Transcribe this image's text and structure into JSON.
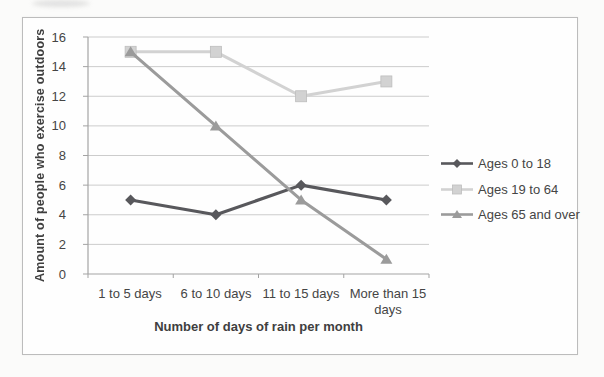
{
  "chart_data": {
    "type": "line",
    "title": "",
    "xlabel": "Number of days of rain per month",
    "ylabel": "Amount of people who exercise outdoors",
    "categories": [
      "1 to 5 days",
      "6 to 10 days",
      "11 to 15 days",
      "More than 15 days"
    ],
    "series": [
      {
        "name": "Ages 0 to 18",
        "values": [
          5,
          4,
          6,
          5
        ],
        "color": "#58585c",
        "marker": "diamond"
      },
      {
        "name": "Ages 19 to 64",
        "values": [
          15,
          15,
          12,
          13
        ],
        "color": "#d2d2d2",
        "marker": "square"
      },
      {
        "name": "Ages 65 and over",
        "values": [
          15,
          10,
          5,
          1
        ],
        "color": "#9b9b9b",
        "marker": "triangle"
      }
    ],
    "ylim": [
      0,
      16
    ],
    "ytick_step": 2,
    "yticks": [
      0,
      2,
      4,
      6,
      8,
      10,
      12,
      14,
      16
    ],
    "grid": true,
    "legend_position": "right",
    "colors": {
      "gridline": "#cccccc",
      "axis": "#a3a3a3",
      "frame_border": "#bcbcbc",
      "text": "#454545"
    }
  }
}
